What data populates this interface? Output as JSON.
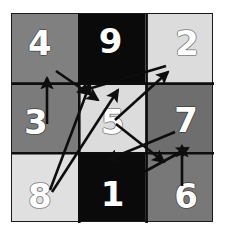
{
  "figure": {
    "background_color": "#ffffff",
    "border_color": "#1b1b1b"
  },
  "palette": {
    "black": "#0a0a0a",
    "dark_gray": "#6e6e6e",
    "mid_gray": "#808080",
    "light_gray": "#dcdcdc",
    "pale_gray": "#e6e6e6",
    "label_color": "#ffffff",
    "arrow_color": "#0d0d0d"
  },
  "chart_data": {
    "type": "diagram",
    "title": "",
    "grid": {
      "rows": 3,
      "cols": 3
    },
    "cells": [
      {
        "id": "r1c1",
        "label": "4",
        "row": 1,
        "col": 1,
        "fill": "#808080",
        "position": "pos-tl"
      },
      {
        "id": "r1c2",
        "label": "9",
        "row": 1,
        "col": 2,
        "fill": "#0a0a0a",
        "position": "pos-tc"
      },
      {
        "id": "r1c3",
        "label": "2",
        "row": 1,
        "col": 3,
        "fill": "#dcdcdc",
        "position": "pos-tr"
      },
      {
        "id": "r2c1",
        "label": "3",
        "row": 2,
        "col": 1,
        "fill": "#7b7b7b",
        "position": "pos-ml"
      },
      {
        "id": "r2c2",
        "label": "5",
        "row": 2,
        "col": 2,
        "fill": "#dcdcdc",
        "position": "pos-mc"
      },
      {
        "id": "r2c3",
        "label": "7",
        "row": 2,
        "col": 3,
        "fill": "#6e6e6e",
        "position": "pos-mr"
      },
      {
        "id": "r3c1",
        "label": "8",
        "row": 3,
        "col": 1,
        "fill": "#e0e0e0",
        "position": "pos-bl"
      },
      {
        "id": "r3c2",
        "label": "1",
        "row": 3,
        "col": 2,
        "fill": "#0a0a0a",
        "position": "pos-bc"
      },
      {
        "id": "r3c3",
        "label": "6",
        "row": 3,
        "col": 3,
        "fill": "#787878",
        "position": "pos-br"
      }
    ],
    "arrows": [
      {
        "id": "a1",
        "from": "3",
        "to": "4",
        "x1": 35,
        "y1": 110,
        "x2": 35,
        "y2": 64
      },
      {
        "id": "a2",
        "from": "4",
        "to": "5",
        "x1": 44,
        "y1": 57,
        "x2": 86,
        "y2": 86
      },
      {
        "id": "a3",
        "from": "8",
        "to": "9",
        "x1": 38,
        "y1": 176,
        "x2": 78,
        "y2": 70
      },
      {
        "id": "a4",
        "from": "8",
        "to": "5",
        "x1": 40,
        "y1": 178,
        "x2": 106,
        "y2": 76
      },
      {
        "id": "a5",
        "from": "2",
        "to": "1",
        "x1": 154,
        "y1": 52,
        "x2": 66,
        "y2": 78
      },
      {
        "id": "a6",
        "from": "5",
        "to": "2",
        "x1": 103,
        "y1": 106,
        "x2": 156,
        "y2": 58
      },
      {
        "id": "a7",
        "from": "6",
        "to": "7",
        "x1": 170,
        "y1": 172,
        "x2": 170,
        "y2": 132
      },
      {
        "id": "a8",
        "from": "5",
        "to": "6",
        "x1": 104,
        "y1": 110,
        "x2": 152,
        "y2": 148
      },
      {
        "id": "a9",
        "from": "7",
        "to": "1",
        "x1": 163,
        "y1": 118,
        "x2": 95,
        "y2": 146
      },
      {
        "id": "a10",
        "from": "1",
        "to": "7",
        "x1": 132,
        "y1": 158,
        "x2": 176,
        "y2": 134
      }
    ],
    "xlabel": "",
    "ylabel": "",
    "legend": []
  },
  "cell_labels": [
    "4",
    "9",
    "2",
    "3",
    "5",
    "7",
    "8",
    "1",
    "6"
  ]
}
